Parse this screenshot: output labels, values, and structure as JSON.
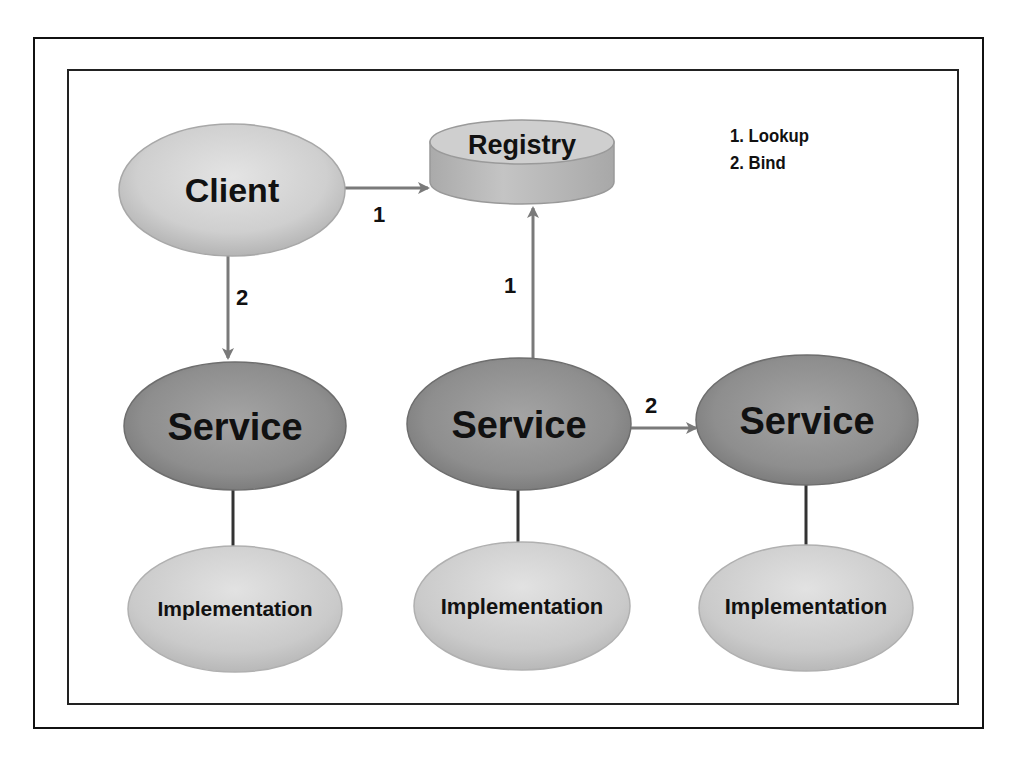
{
  "diagram": {
    "nodes": {
      "client": {
        "label": "Client"
      },
      "registry": {
        "label": "Registry"
      },
      "service_left": {
        "label": "Service"
      },
      "service_middle": {
        "label": "Service"
      },
      "service_right": {
        "label": "Service"
      },
      "impl_left": {
        "label": "Implementation"
      },
      "impl_middle": {
        "label": "Implementation"
      },
      "impl_right": {
        "label": "Implementation"
      }
    },
    "edges": {
      "client_to_registry": {
        "label": "1"
      },
      "client_to_service_left": {
        "label": "2"
      },
      "service_middle_to_registry": {
        "label": "1"
      },
      "service_middle_to_service_right": {
        "label": "2"
      }
    },
    "legend": {
      "items": [
        "1. Lookup",
        "2. Bind"
      ]
    },
    "colors": {
      "light_node": "#d4d4d4",
      "dark_node": "#8c8c8c",
      "arrow": "#7a7a7a",
      "connector": "#333333",
      "frame": "#111111"
    }
  }
}
